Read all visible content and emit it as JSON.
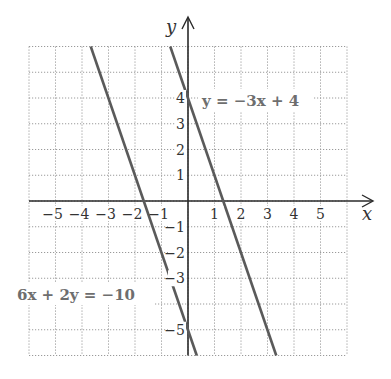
{
  "chart_data": {
    "type": "line",
    "title": "",
    "xlabel": "x",
    "ylabel": "y",
    "xlim": [
      -6,
      6
    ],
    "ylim": [
      -6,
      6
    ],
    "grid": true,
    "x_ticks": [
      "−5",
      "−4",
      "−3",
      "−2",
      "−1",
      "1",
      "2",
      "3",
      "4",
      "5"
    ],
    "y_ticks": [
      "4",
      "3",
      "2",
      "1",
      "−1",
      "−2",
      "−3",
      "−5"
    ],
    "series": [
      {
        "name": "y = −3x + 4",
        "equation": "y = -3x + 4",
        "slope": -3,
        "intercept": 4,
        "points": [
          [
            -0.67,
            6
          ],
          [
            3.33,
            -6
          ]
        ]
      },
      {
        "name": "6x + 2y = −10",
        "equation": "6x + 2y = -10",
        "slope": -3,
        "intercept": -5,
        "points": [
          [
            -3.67,
            6
          ],
          [
            0.33,
            -6
          ]
        ]
      }
    ],
    "annotations": [
      {
        "text": "y = −3x + 4",
        "near": [
          0.5,
          3.5
        ]
      },
      {
        "text": "6x + 2y = −10",
        "near": [
          -5.5,
          -3.5
        ]
      }
    ]
  },
  "labels": {
    "x_axis": "x",
    "y_axis": "y",
    "line1_label": "y = −3x + 4",
    "line2_label": "6x + 2y = −10"
  },
  "colors": {
    "axis": "#2a2a2a",
    "grid": "#9a9a9a",
    "lines": "#5a5a5a",
    "label": "#6e6e6e"
  }
}
